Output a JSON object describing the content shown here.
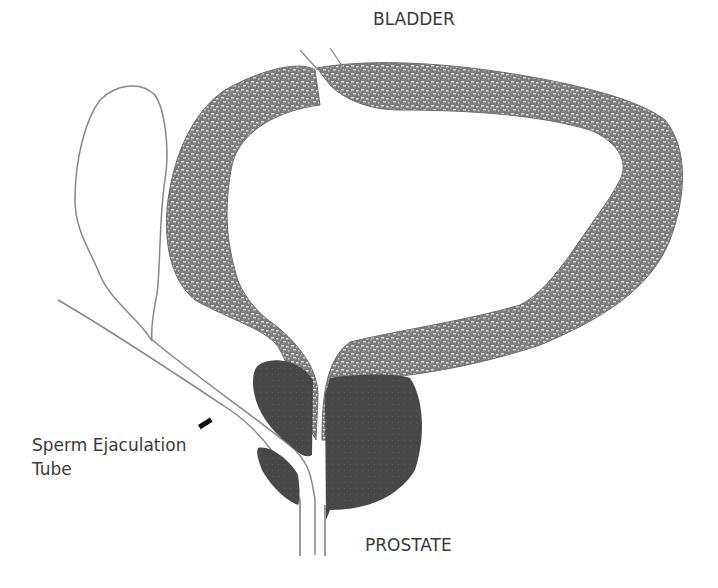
{
  "diagram": {
    "type": "anatomical illustration",
    "labels": {
      "bladder": "BLADDER",
      "prostate": "PROSTATE",
      "tube_line1": "Sperm Ejaculation",
      "tube_line2": "Tube"
    },
    "colors": {
      "bladder_wall": "#8a8a8a",
      "bladder_texture_light": "#d8d8d8",
      "prostate": "#4a4a4a",
      "outline": "#777777",
      "label_text": "#3a3a3a",
      "pointer": "#111111"
    }
  }
}
